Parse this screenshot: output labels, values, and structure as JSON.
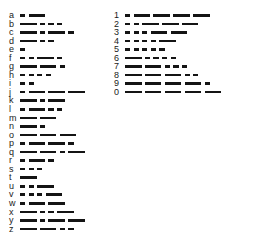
{
  "chart": {
    "symbol_glyphs": {
      "dot": "·",
      "dash": "−"
    },
    "ink_color": "#141414",
    "label_color": "#1a1a1a",
    "background_color": "#ffffff"
  },
  "letters": [
    {
      "label": "a",
      "code": ".-",
      "symbols": [
        "dot",
        "dash"
      ]
    },
    {
      "label": "b",
      "code": "-...",
      "symbols": [
        "dash",
        "dot",
        "dot",
        "dot"
      ]
    },
    {
      "label": "c",
      "code": "-.-.",
      "symbols": [
        "dash",
        "dot",
        "dash",
        "dot"
      ]
    },
    {
      "label": "d",
      "code": "-..",
      "symbols": [
        "dash",
        "dot",
        "dot"
      ]
    },
    {
      "label": "e",
      "code": ".",
      "symbols": [
        "dot"
      ]
    },
    {
      "label": "f",
      "code": "..-.",
      "symbols": [
        "dot",
        "dot",
        "dash",
        "dot"
      ]
    },
    {
      "label": "g",
      "code": "--.",
      "symbols": [
        "dash",
        "dash",
        "dot"
      ]
    },
    {
      "label": "h",
      "code": "....",
      "symbols": [
        "dot",
        "dot",
        "dot",
        "dot"
      ]
    },
    {
      "label": "i",
      "code": "..",
      "symbols": [
        "dot",
        "dot"
      ]
    },
    {
      "label": "j",
      "code": ".---",
      "symbols": [
        "dot",
        "dash",
        "dash",
        "dash"
      ]
    },
    {
      "label": "k",
      "code": "-.-",
      "symbols": [
        "dash",
        "dot",
        "dash"
      ]
    },
    {
      "label": "l",
      "code": ".-..",
      "symbols": [
        "dot",
        "dash",
        "dot",
        "dot"
      ]
    },
    {
      "label": "m",
      "code": "--",
      "symbols": [
        "dash",
        "dash"
      ]
    },
    {
      "label": "n",
      "code": "-.",
      "symbols": [
        "dash",
        "dot"
      ]
    },
    {
      "label": "o",
      "code": "---",
      "symbols": [
        "dash",
        "dash",
        "dash"
      ]
    },
    {
      "label": "p",
      "code": ".--.",
      "symbols": [
        "dot",
        "dash",
        "dash",
        "dot"
      ]
    },
    {
      "label": "q",
      "code": "--.-",
      "symbols": [
        "dash",
        "dash",
        "dot",
        "dash"
      ]
    },
    {
      "label": "r",
      "code": ".-.",
      "symbols": [
        "dot",
        "dash",
        "dot"
      ]
    },
    {
      "label": "s",
      "code": "...",
      "symbols": [
        "dot",
        "dot",
        "dot"
      ]
    },
    {
      "label": "t",
      "code": "-",
      "symbols": [
        "dash"
      ]
    },
    {
      "label": "u",
      "code": "..-",
      "symbols": [
        "dot",
        "dot",
        "dash"
      ]
    },
    {
      "label": "v",
      "code": "...-",
      "symbols": [
        "dot",
        "dot",
        "dot",
        "dash"
      ]
    },
    {
      "label": "w",
      "code": ".--",
      "symbols": [
        "dot",
        "dash",
        "dash"
      ]
    },
    {
      "label": "x",
      "code": "-..-",
      "symbols": [
        "dash",
        "dot",
        "dot",
        "dash"
      ]
    },
    {
      "label": "y",
      "code": "-.--",
      "symbols": [
        "dash",
        "dot",
        "dash",
        "dash"
      ]
    },
    {
      "label": "z",
      "code": "--..",
      "symbols": [
        "dash",
        "dash",
        "dot",
        "dot"
      ]
    }
  ],
  "numbers": [
    {
      "label": "1",
      "code": ".----",
      "symbols": [
        "dot",
        "dash",
        "dash",
        "dash",
        "dash"
      ]
    },
    {
      "label": "2",
      "code": "..---",
      "symbols": [
        "dot",
        "dot",
        "dash",
        "dash",
        "dash"
      ]
    },
    {
      "label": "3",
      "code": "...--",
      "symbols": [
        "dot",
        "dot",
        "dot",
        "dash",
        "dash"
      ]
    },
    {
      "label": "4",
      "code": "....-",
      "symbols": [
        "dot",
        "dot",
        "dot",
        "dot",
        "dash"
      ]
    },
    {
      "label": "5",
      "code": ".....",
      "symbols": [
        "dot",
        "dot",
        "dot",
        "dot",
        "dot"
      ]
    },
    {
      "label": "6",
      "code": "-....",
      "symbols": [
        "dash",
        "dot",
        "dot",
        "dot",
        "dot"
      ]
    },
    {
      "label": "7",
      "code": "--...",
      "symbols": [
        "dash",
        "dash",
        "dot",
        "dot",
        "dot"
      ]
    },
    {
      "label": "8",
      "code": "---..",
      "symbols": [
        "dash",
        "dash",
        "dash",
        "dot",
        "dot"
      ]
    },
    {
      "label": "9",
      "code": "----.",
      "symbols": [
        "dash",
        "dash",
        "dash",
        "dash",
        "dot"
      ]
    },
    {
      "label": "0",
      "code": "-----",
      "symbols": [
        "dash",
        "dash",
        "dash",
        "dash",
        "dash"
      ]
    }
  ]
}
